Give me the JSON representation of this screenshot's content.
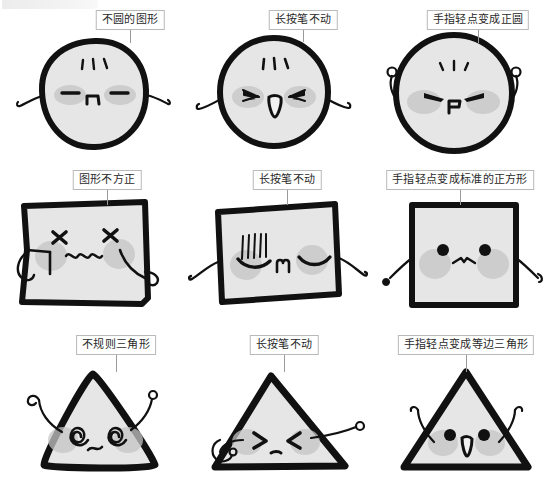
{
  "page": {
    "columns": 3,
    "rows": 3,
    "colors": {
      "ink": "#111111",
      "shape_fill": "#e6e6e6",
      "blush": "#c4c4c4",
      "label_border": "#b9b9b9",
      "label_bg": "#ffffff",
      "leader_line": "#9a9a9a",
      "background": "#ffffff"
    }
  },
  "rows": [
    {
      "shape": "circle",
      "cells": [
        {
          "label": "不圆的图形",
          "shape_name": "irregular-circle",
          "face": "closed-eyes-flat-mouth",
          "arms": "drooping"
        },
        {
          "label": "长按笔不动",
          "shape_name": "circle-pressing",
          "face": "squint-eyes-open-mouth",
          "arms": "side-out"
        },
        {
          "label": "手指轻点变成正圆",
          "shape_name": "perfect-circle",
          "face": "squint-eyes-small-mouth",
          "arms": "raised"
        }
      ]
    },
    {
      "shape": "square",
      "cells": [
        {
          "label": "图形不方正",
          "shape_name": "irregular-square",
          "face": "x-eyes-wavy-mouth",
          "arms": "drooping"
        },
        {
          "label": "长按笔不动",
          "shape_name": "square-pressing",
          "face": "closed-eyes-m-mouth",
          "arms": "side-down"
        },
        {
          "label": "手指轻点变成标准的正方形",
          "shape_name": "perfect-square",
          "face": "dot-eyes-bow-mouth",
          "arms": "side-down"
        }
      ]
    },
    {
      "shape": "triangle",
      "cells": [
        {
          "label": "不规则三角形",
          "shape_name": "irregular-triangle",
          "face": "spiral-eyes-wavy-mouth",
          "arms": "raised-antenna"
        },
        {
          "label": "长按笔不动",
          "shape_name": "triangle-pressing",
          "face": "gt-lt-eyes-small-mouth",
          "arms": "pin-arms"
        },
        {
          "label": "手指轻点变成等边三角形",
          "shape_name": "equilateral-triangle",
          "face": "dot-eyes-open-mouth",
          "arms": "raised"
        }
      ]
    }
  ]
}
